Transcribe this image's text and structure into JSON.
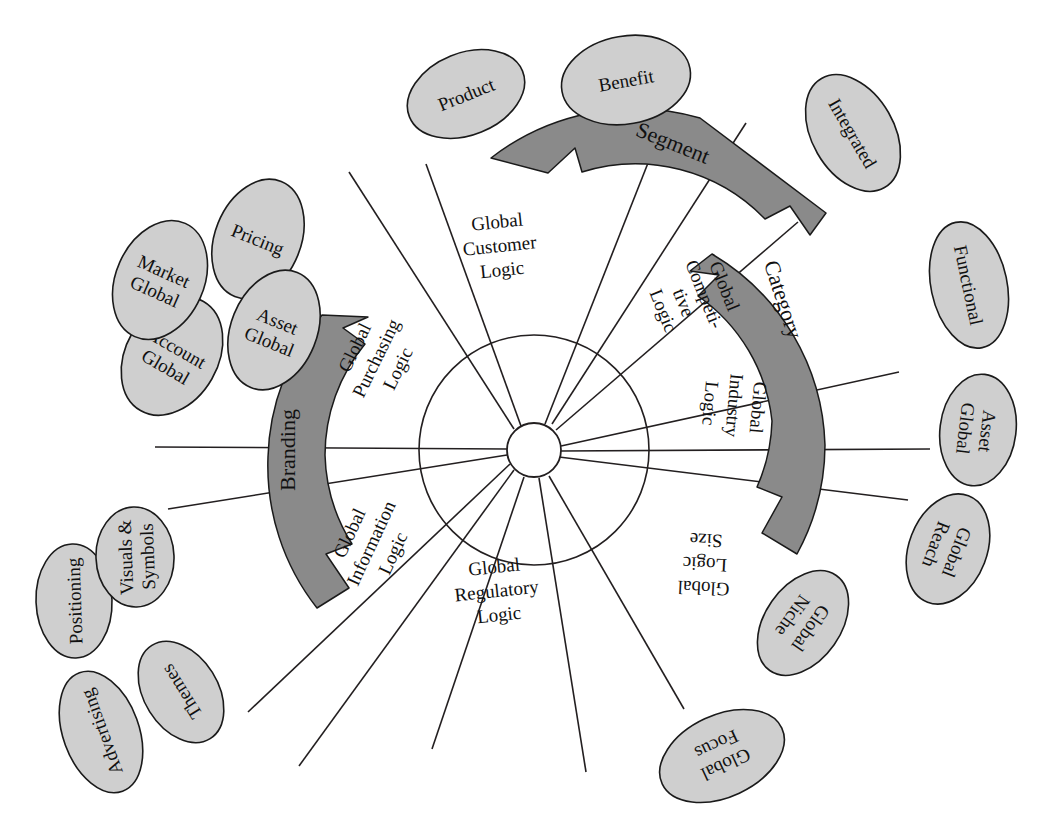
{
  "diagram": {
    "hub": {
      "inner_radius": 27,
      "outer_radius": 115,
      "center_x": 534,
      "center_y": 450
    },
    "colors": {
      "background": "#ffffff",
      "band_fill": "#8a8a8a",
      "band_stroke": "#1a1a1a",
      "ellipse_fill": "#cfcfcf",
      "ellipse_stroke": "#1a1a1a",
      "line": "#231f20",
      "text": "#111111"
    },
    "sector_labels": [
      {
        "id": "global-customer-logic",
        "lines": [
          "Global",
          "Customer",
          "Logic"
        ],
        "x": 500,
        "y": 250,
        "rotation": -6
      },
      {
        "id": "global-competitive-logic",
        "lines": [
          "Global",
          "Competi-",
          "tive",
          "Logic"
        ],
        "x": 690,
        "y": 300,
        "rotation": 68
      },
      {
        "id": "global-industry-logic",
        "lines": [
          "Global",
          "Industry",
          "Logic"
        ],
        "x": 730,
        "y": 405,
        "rotation": 95
      },
      {
        "id": "global-size-logic",
        "lines": [
          "Global",
          "Logic",
          "Size"
        ],
        "x": 705,
        "y": 560,
        "rotation": 183
      },
      {
        "id": "global-regulatory-logic",
        "lines": [
          "Global",
          "Regulatory",
          "Logic"
        ],
        "x": 497,
        "y": 595,
        "rotation": -6
      },
      {
        "id": "global-information-logic",
        "lines": [
          "Global",
          "Information",
          "Logic"
        ],
        "x": 375,
        "y": 545,
        "rotation": -65
      },
      {
        "id": "global-purchasing-logic",
        "lines": [
          "Global",
          "Purchasing",
          "Logic"
        ],
        "x": 380,
        "y": 360,
        "rotation": -64
      }
    ],
    "bands": [
      {
        "id": "segment",
        "label": "Segment",
        "label_x": 672,
        "label_y": 145,
        "label_rotation": 22
      },
      {
        "id": "category",
        "label": "Category",
        "label_x": 781,
        "label_y": 300,
        "label_rotation": 72
      },
      {
        "id": "branding",
        "label": "Branding",
        "label_x": 290,
        "label_y": 450,
        "label_rotation": -90
      }
    ],
    "nodes": [
      {
        "id": "product",
        "lines": [
          "Product"
        ],
        "cx": 466,
        "cy": 94,
        "rx": 61,
        "ry": 41,
        "rotation": -22
      },
      {
        "id": "benefit",
        "lines": [
          "Benefit"
        ],
        "cx": 626,
        "cy": 80,
        "rx": 65,
        "ry": 44,
        "rotation": -10
      },
      {
        "id": "integrated",
        "lines": [
          "Integrated"
        ],
        "cx": 853,
        "cy": 133,
        "rx": 63,
        "ry": 41,
        "rotation": 60
      },
      {
        "id": "functional",
        "lines": [
          "Functional"
        ],
        "cx": 969,
        "cy": 285,
        "rx": 64,
        "ry": 38,
        "rotation": 78
      },
      {
        "id": "asset-global-right",
        "lines": [
          "Asset",
          "Global"
        ],
        "cx": 978,
        "cy": 430,
        "rx": 56,
        "ry": 38,
        "rotation": 97
      },
      {
        "id": "global-reach",
        "lines": [
          "Global",
          "Reach"
        ],
        "cx": 948,
        "cy": 549,
        "rx": 57,
        "ry": 39,
        "rotation": 111
      },
      {
        "id": "global-niche",
        "lines": [
          "Global",
          "Niche"
        ],
        "cx": 803,
        "cy": 623,
        "rx": 58,
        "ry": 38,
        "rotation": 125
      },
      {
        "id": "global-focus",
        "lines": [
          "Global",
          "Focus"
        ],
        "cx": 722,
        "cy": 756,
        "rx": 66,
        "ry": 41,
        "rotation": 155
      },
      {
        "id": "advertising",
        "lines": [
          "Advertising"
        ],
        "cx": 101,
        "cy": 732,
        "rx": 63,
        "ry": 38,
        "rotation": 250
      },
      {
        "id": "themes",
        "lines": [
          "Themes"
        ],
        "cx": 181,
        "cy": 692,
        "rx": 55,
        "ry": 37,
        "rotation": 238
      },
      {
        "id": "positioning",
        "lines": [
          "Positioning"
        ],
        "cx": 74,
        "cy": 601,
        "rx": 57,
        "ry": 38,
        "rotation": 268
      },
      {
        "id": "visuals-symbols",
        "lines": [
          "Visuals &",
          "Symbols"
        ],
        "cx": 135,
        "cy": 557,
        "rx": 50,
        "ry": 39,
        "rotation": 268
      },
      {
        "id": "account-global",
        "lines": [
          "Account",
          "Global"
        ],
        "cx": 172,
        "cy": 356,
        "rx": 46,
        "ry": 63,
        "rotation": 30
      },
      {
        "id": "market-global",
        "lines": [
          "Market",
          "Global"
        ],
        "cx": 160,
        "cy": 280,
        "rx": 44,
        "ry": 62,
        "rotation": 24
      },
      {
        "id": "pricing",
        "lines": [
          "Pricing"
        ],
        "cx": 258,
        "cy": 239,
        "rx": 43,
        "ry": 62,
        "rotation": 22
      },
      {
        "id": "asset-global-left",
        "lines": [
          "Asset",
          "Global"
        ],
        "cx": 274,
        "cy": 330,
        "rx": 43,
        "ry": 62,
        "rotation": 22
      }
    ]
  }
}
